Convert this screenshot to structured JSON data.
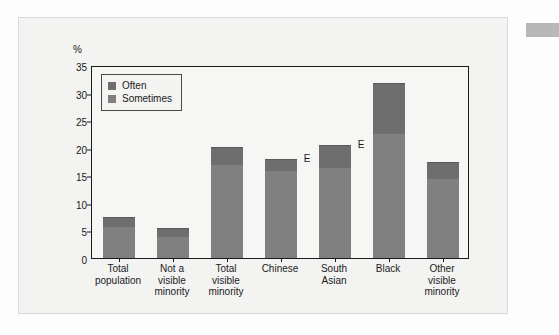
{
  "figure": {
    "axis_unit_label": "%",
    "quality_flag": "E"
  },
  "legend": {
    "items": [
      {
        "label": "Often",
        "color": "#6e6e6e",
        "swatch_name": "legend-swatch-often"
      },
      {
        "label": "Sometimes",
        "color": "#808080",
        "swatch_name": "legend-swatch-sometimes"
      }
    ]
  },
  "chart_data": {
    "type": "bar",
    "subtype": "stacked-bar",
    "title": "",
    "subtitle": "",
    "xlabel": "",
    "ylabel": "%",
    "ylim": [
      0,
      35
    ],
    "yticks": [
      0,
      5,
      10,
      15,
      20,
      25,
      30,
      35
    ],
    "ytick_labels": [
      "0",
      "5",
      "10",
      "15",
      "20",
      "25",
      "30",
      "35"
    ],
    "grid": false,
    "legend_position": "upper-left-inside",
    "categories": [
      "Total population",
      "Not a visible minority",
      "Total visible minority",
      "Chinese",
      "South Asian",
      "Black",
      "Other visible minority"
    ],
    "category_label_lines": [
      [
        "Total",
        "population"
      ],
      [
        "Not a",
        "visible",
        "minority"
      ],
      [
        "Total",
        "visible",
        "minority"
      ],
      [
        "Chinese"
      ],
      [
        "South",
        "Asian"
      ],
      [
        "Black"
      ],
      [
        "Other",
        "visible",
        "minority"
      ]
    ],
    "series": [
      {
        "name": "Sometimes",
        "color": "#808080",
        "values": [
          5.6,
          3.8,
          16.9,
          15.7,
          16.4,
          22.4,
          14.3
        ]
      },
      {
        "name": "Often",
        "color": "#6e6e6e",
        "values": [
          1.7,
          1.4,
          3.0,
          2.0,
          4.0,
          9.1,
          2.9
        ]
      }
    ],
    "totals": [
      7.3,
      5.2,
      19.9,
      17.7,
      20.4,
      31.5,
      17.2
    ],
    "annotations": [
      {
        "text": "E",
        "category": "Chinese",
        "value": 17.7
      },
      {
        "text": "E",
        "category": "South Asian",
        "value": 20.4
      }
    ]
  }
}
